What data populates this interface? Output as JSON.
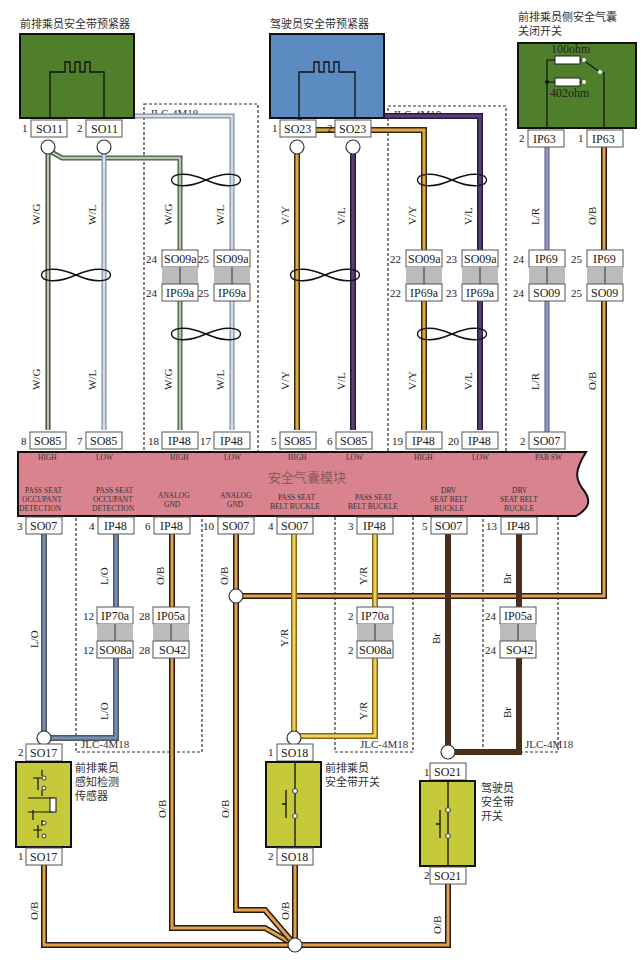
{
  "colors": {
    "green_component": "#4f7f2a",
    "blue_component": "#5b8bc0",
    "yellow_component": "#c6c93a",
    "module_fill": "#d9838f",
    "wire_WG": "#6b8f5a",
    "wire_WL": "#a9bddd",
    "wire_VY": "#e2a640",
    "wire_VL": "#5a3f7a",
    "wire_LR": "#7a9fd6",
    "wire_OB": "#e0a050",
    "wire_LO": "#6e8fc2",
    "wire_YR": "#f0d060",
    "wire_Br": "#4a2e1c"
  },
  "components": {
    "pass_pretensioner": {
      "label": "前排乘员安全带预紧器",
      "pins": [
        {
          "num": "1",
          "conn": "SO11"
        },
        {
          "num": "2",
          "conn": "SO11"
        }
      ]
    },
    "drv_pretensioner": {
      "label": "驾驶员安全带预紧器",
      "pins": [
        {
          "num": "1",
          "conn": "SO23"
        },
        {
          "num": "2",
          "conn": "SO23"
        }
      ]
    },
    "pab_switch": {
      "label_line1": "前排乘员侧安全气囊",
      "label_line2": "关闭开关",
      "r1": "100ohm",
      "r2": "402ohm",
      "pins": [
        {
          "num": "2",
          "conn": "IP63"
        },
        {
          "num": "1",
          "conn": "IP63"
        }
      ]
    },
    "occupant_sensor": {
      "label_line1": "前排乘员",
      "label_line2": "感知检测",
      "label_line3": "传感器",
      "pin_top": {
        "num": "2",
        "conn": "SO17"
      },
      "pin_bottom": {
        "num": "1",
        "conn": "SO17"
      }
    },
    "pass_buckle_switch": {
      "label_line1": "前排乘员",
      "label_line2": "安全带开关",
      "pin_top": {
        "num": "1",
        "conn": "SO18"
      },
      "pin_bottom": {
        "num": "2",
        "conn": "SO18"
      }
    },
    "drv_buckle_switch": {
      "label_line1": "驾驶员",
      "label_line2": "安全带",
      "label_line3": "开关",
      "pin_top": {
        "num": "1",
        "conn": "SO21"
      },
      "pin_bottom": {
        "num": "2",
        "conn": "SO21"
      }
    }
  },
  "module": {
    "title": "安全气囊模块",
    "top_pins": [
      {
        "num": "8",
        "conn": "SO85",
        "func": "HIGH"
      },
      {
        "num": "7",
        "conn": "SO85",
        "func": "LOW"
      },
      {
        "num": "18",
        "conn": "IP48",
        "func": "HIGH"
      },
      {
        "num": "17",
        "conn": "IP48",
        "func": "LOW"
      },
      {
        "num": "5",
        "conn": "SO85",
        "func": "HIGH"
      },
      {
        "num": "6",
        "conn": "SO85",
        "func": "LOW"
      },
      {
        "num": "19",
        "conn": "IP48",
        "func": "HIGH"
      },
      {
        "num": "20",
        "conn": "IP48",
        "func": "LOW"
      },
      {
        "num": "2",
        "conn": "SO07",
        "func": "PAB SW"
      }
    ],
    "bottom_pins": [
      {
        "num": "3",
        "conn": "SO07",
        "func1": "PASS SEAT",
        "func2": "OCCUPANT",
        "func3": "DETECTION"
      },
      {
        "num": "4",
        "conn": "IP48",
        "func1": "PASS SEAT",
        "func2": "OCCUPANT",
        "func3": "DETECTION"
      },
      {
        "num": "6",
        "conn": "IP48",
        "func1": "ANALOG",
        "func2": "GND",
        "func3": ""
      },
      {
        "num": "10",
        "conn": "SO07",
        "func1": "ANALOG",
        "func2": "GND",
        "func3": ""
      },
      {
        "num": "4",
        "conn": "SO07",
        "func1": "PASS SEAT",
        "func2": "BELT BUCKLE",
        "func3": ""
      },
      {
        "num": "3",
        "conn": "IP48",
        "func1": "PASS SEAT",
        "func2": "BELT BUCKLE",
        "func3": ""
      },
      {
        "num": "5",
        "conn": "SO07",
        "func1": "DRV",
        "func2": "SEAT BELT",
        "func3": "BUCKLE"
      },
      {
        "num": "13",
        "conn": "IP48",
        "func1": "DRV",
        "func2": "SEAT BELT",
        "func3": "BUCKLE"
      }
    ]
  },
  "inline_connectors": {
    "upper": [
      {
        "top_num": "24",
        "top": "SO09a",
        "bot_num": "24",
        "bot": "IP69a"
      },
      {
        "top_num": "25",
        "top": "SO09a",
        "bot_num": "25",
        "bot": "IP69a"
      },
      {
        "top_num": "22",
        "top": "SO09a",
        "bot_num": "22",
        "bot": "IP69a"
      },
      {
        "top_num": "23",
        "top": "SO09a",
        "bot_num": "23",
        "bot": "IP69a"
      },
      {
        "top_num": "24",
        "top": "IP69",
        "bot_num": "24",
        "bot": "SO09"
      },
      {
        "top_num": "25",
        "top": "IP69",
        "bot_num": "25",
        "bot": "SO09"
      }
    ],
    "lower": [
      {
        "top_num": "12",
        "top": "IP70a",
        "bot_num": "12",
        "bot": "SO08a"
      },
      {
        "top_num": "28",
        "top": "IP05a",
        "bot_num": "28",
        "bot": "SO42"
      },
      {
        "top_num": "2",
        "top": "IP70a",
        "bot_num": "2",
        "bot": "SO08a"
      },
      {
        "top_num": "24",
        "top": "IP05a",
        "bot_num": "24",
        "bot": "SO42"
      }
    ]
  },
  "wire_labels": {
    "WG": "W/G",
    "WL": "W/L",
    "VY": "V/Y",
    "VL": "V/L",
    "LR": "L/R",
    "OB": "O/B",
    "LO": "L/O",
    "YR": "Y/R",
    "Br": "Br"
  },
  "harness_label": "JLC-4M18"
}
